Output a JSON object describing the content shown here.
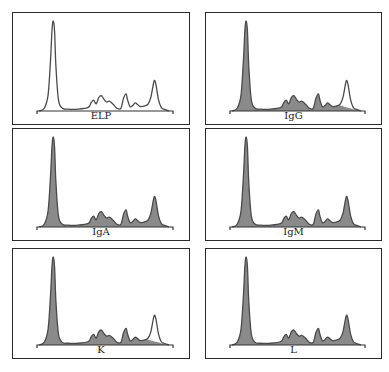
{
  "chart_data": {
    "type": "area",
    "title": "",
    "layout": {
      "rows": 3,
      "cols": 2,
      "grid": false,
      "legend": "none"
    },
    "x_domain": [
      0,
      100
    ],
    "y_domain": [
      0,
      100
    ],
    "profile_x": [
      0,
      4,
      7,
      9,
      10,
      11,
      12,
      13,
      15,
      18,
      22,
      30,
      38,
      40,
      42,
      44,
      46,
      48,
      50,
      52,
      54,
      56,
      58,
      60,
      63,
      65,
      67,
      68,
      70,
      72,
      74,
      76,
      78,
      82,
      84,
      86,
      88,
      89,
      90,
      92,
      94,
      96,
      100
    ],
    "profile_y": [
      0,
      3,
      18,
      60,
      90,
      100,
      88,
      50,
      12,
      3,
      2,
      2,
      4,
      9,
      12,
      8,
      15,
      17,
      13,
      10,
      11,
      9,
      6,
      3,
      3,
      14,
      19,
      13,
      5,
      6,
      9,
      7,
      5,
      6,
      8,
      15,
      30,
      34,
      29,
      12,
      4,
      2,
      0
    ],
    "panels": [
      {
        "id": "ELP",
        "label": "ELP",
        "fill": "none",
        "unfilled_peak": null
      },
      {
        "id": "IgG",
        "label": "IgG",
        "fill": "shaded",
        "unfilled_peak": {
          "x_from": 84,
          "x_to": 96
        }
      },
      {
        "id": "IgA",
        "label": "IgA",
        "fill": "shaded",
        "unfilled_peak": null
      },
      {
        "id": "IgM",
        "label": "IgM",
        "fill": "shaded",
        "unfilled_peak": null
      },
      {
        "id": "K",
        "label": "K",
        "fill": "shaded",
        "unfilled_peak": {
          "x_from": 84,
          "x_to": 96
        }
      },
      {
        "id": "L",
        "label": "L",
        "fill": "shaded",
        "unfilled_peak": null
      }
    ],
    "colors": {
      "line": "#4a4a4a",
      "fill": "#8a8a8a",
      "border": "#2a2a2a",
      "background": "#ffffff"
    }
  },
  "panels": [
    {
      "label": "ELP"
    },
    {
      "label": "IgG"
    },
    {
      "label": "IgA"
    },
    {
      "label": "IgM"
    },
    {
      "label": "K"
    },
    {
      "label": "L"
    }
  ]
}
